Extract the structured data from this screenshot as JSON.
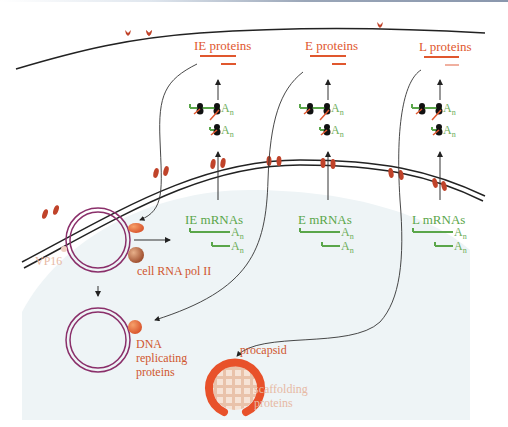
{
  "diagram": {
    "protein_labels": [
      "IE proteins",
      "E proteins",
      "L proteins"
    ],
    "mrna_labels": [
      "IE mRNAs",
      "E mRNAs",
      "L mRNAs"
    ],
    "polyA_label": "A",
    "polyA_sub": "n",
    "nucleus_labels": {
      "vp16": "VP16",
      "rna_pol": "cell RNA pol II",
      "dna_rep_1": "DNA",
      "dna_rep_2": "replicating",
      "dna_rep_3": "proteins",
      "procapsid": "procapsid",
      "scaffold_1": "scaffolding",
      "scaffold_2": "proteins"
    },
    "colors": {
      "protein": "#e0572e",
      "mrna": "#5aa64a",
      "dna_ring": "#8a2f6a",
      "nuclear_pore": "#c0432a",
      "nucleoplasm": "#eef4f6",
      "pale_label": "#e7b9a4"
    }
  }
}
